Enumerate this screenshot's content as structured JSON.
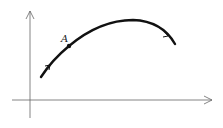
{
  "diagram": {
    "point_label": "A",
    "colors": {
      "axis": "#555555",
      "curve": "#111111"
    }
  }
}
